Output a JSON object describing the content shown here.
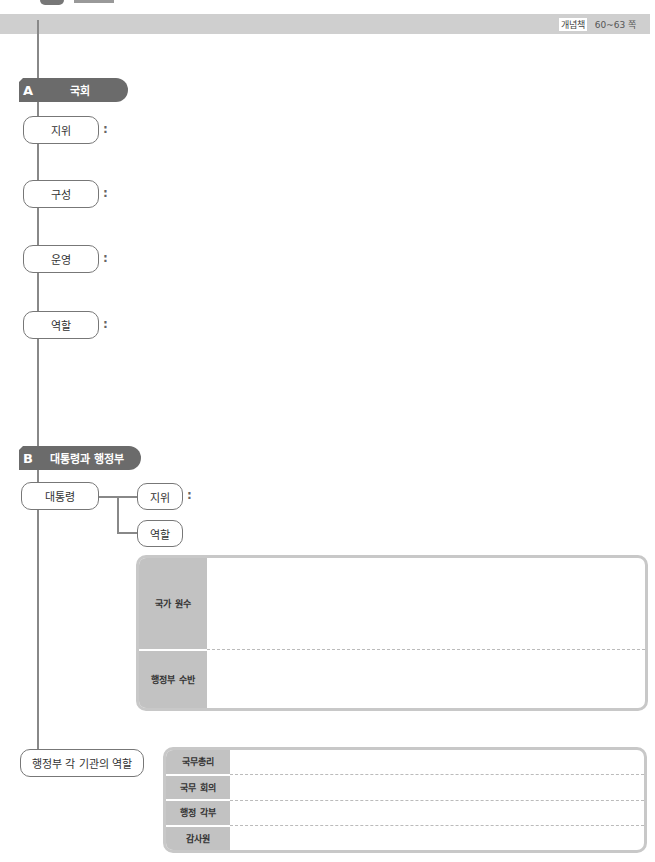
{
  "header": {
    "book_label": "개념책",
    "pages": "60~63 쪽"
  },
  "section_a": {
    "letter": "A",
    "title": "국회",
    "items": [
      {
        "label": "지위",
        "colon": ":"
      },
      {
        "label": "구성",
        "colon": ":"
      },
      {
        "label": "운영",
        "colon": ":"
      },
      {
        "label": "역할",
        "colon": ":"
      }
    ]
  },
  "section_b": {
    "letter": "B",
    "title": "대통령과 행정부",
    "president": {
      "label": "대통령",
      "branches": [
        {
          "label": "지위",
          "colon": ":"
        },
        {
          "label": "역할"
        }
      ]
    },
    "role_table": {
      "rows": [
        {
          "label": "국가 원수",
          "value": ""
        },
        {
          "label": "행정부 수반",
          "value": ""
        }
      ]
    },
    "agencies": {
      "label": "행정부 각 기관의 역할",
      "rows": [
        {
          "label": "국무총리",
          "value": ""
        },
        {
          "label": "국무 회의",
          "value": ""
        },
        {
          "label": "행정 각부",
          "value": ""
        },
        {
          "label": "감사원",
          "value": ""
        }
      ]
    }
  },
  "colors": {
    "header_bar": "#cfcfcf",
    "section_tag": "#6b6b6b",
    "table_label_bg": "#c2c2c2",
    "box_border": "#c8c8c8",
    "line": "#888888"
  }
}
